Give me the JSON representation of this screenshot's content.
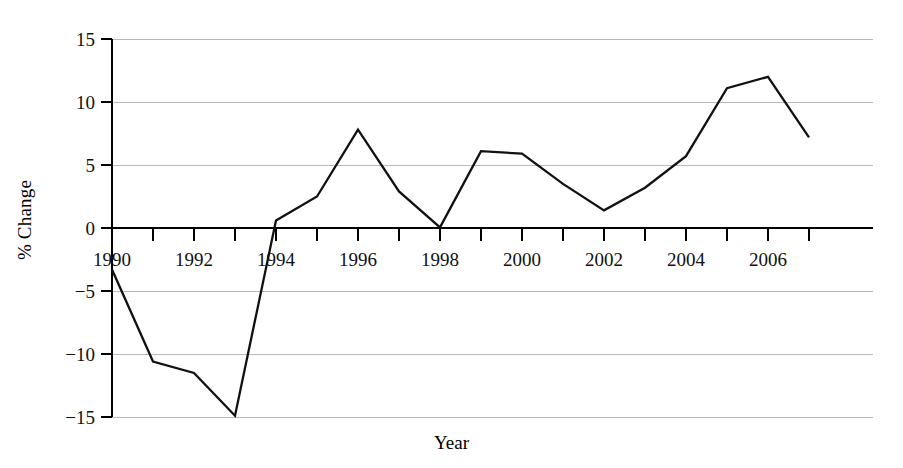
{
  "chart_data": {
    "type": "line",
    "title": "",
    "xlabel": "Year",
    "ylabel": "% Change",
    "x": [
      1990,
      1991,
      1992,
      1993,
      1994,
      1995,
      1996,
      1997,
      1998,
      1999,
      2000,
      2001,
      2002,
      2003,
      2004,
      2005,
      2006,
      2007
    ],
    "values": [
      -3.3,
      -10.6,
      -11.5,
      -14.9,
      0.6,
      2.5,
      7.8,
      2.9,
      0.05,
      6.1,
      5.9,
      3.5,
      1.4,
      3.2,
      5.7,
      11.1,
      12.0,
      7.2
    ],
    "series": [
      {
        "name": "% Change",
        "values": [
          -3.3,
          -10.6,
          -11.5,
          -14.9,
          0.6,
          2.5,
          7.8,
          2.9,
          0.05,
          6.1,
          5.9,
          3.5,
          1.4,
          3.2,
          5.7,
          11.1,
          12.0,
          7.2
        ]
      }
    ],
    "xlim": [
      1990,
      2007
    ],
    "ylim": [
      -15,
      15
    ],
    "ytick_values": [
      15,
      10,
      5,
      0,
      -5,
      -10,
      -15
    ],
    "ytick_labels": [
      "15",
      "10",
      "5",
      "0",
      "−5",
      "−10",
      "−15"
    ],
    "xtick_values": [
      1990,
      1991,
      1992,
      1993,
      1994,
      1995,
      1996,
      1997,
      1998,
      1999,
      2000,
      2001,
      2002,
      2003,
      2004,
      2005,
      2006,
      2007
    ],
    "xtick_labels": [
      "1990",
      "",
      "1992",
      "",
      "1994",
      "",
      "1996",
      "",
      "1998",
      "",
      "2000",
      "",
      "2002",
      "",
      "2004",
      "",
      "2006",
      ""
    ],
    "grid": true,
    "grid_axis": "y",
    "grid_color": "#b9b9b9",
    "line_color": "#111111",
    "legend": false,
    "legend_position": "none",
    "background_color": "#ffffff"
  }
}
